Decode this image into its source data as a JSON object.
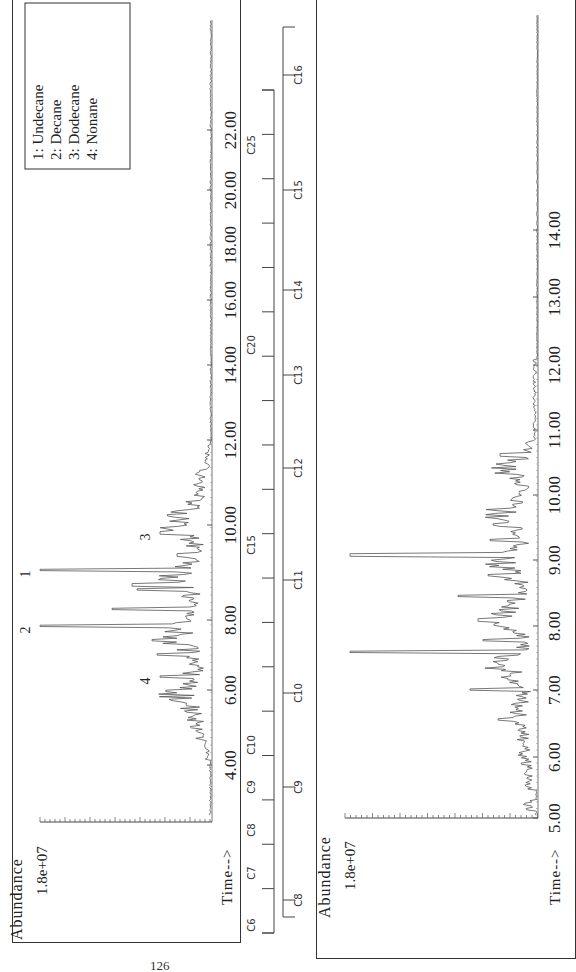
{
  "page": {
    "number": "126"
  },
  "chart_data": [
    {
      "type": "line",
      "title": "GC-MS Total Ion Chromatogram (panel 1)",
      "orientation": "rotated 90° counter-clockwise",
      "xlabel": "Time-->",
      "ylabel": "Abundance",
      "y_max_label": "1.8e+07",
      "xlim": [
        3.0,
        23.0
      ],
      "x_ticks": [
        "4.00",
        "6.00",
        "8.00",
        "10.00",
        "12.00",
        "14.00",
        "16.00",
        "18.00",
        "20.00",
        "22.00"
      ],
      "legend": [
        {
          "id": "1",
          "name": "Undecane"
        },
        {
          "id": "2",
          "name": "Decane"
        },
        {
          "id": "3",
          "name": "Dodecane"
        },
        {
          "id": "4",
          "name": "Nonane"
        }
      ],
      "labeled_peaks": [
        {
          "label": "1",
          "time": 9.7,
          "rel_abundance": 1.0
        },
        {
          "label": "2",
          "time": 8.15,
          "rel_abundance": 1.0
        },
        {
          "label": "3",
          "time": 10.7,
          "rel_abundance": 0.3
        },
        {
          "label": "4",
          "time": 6.75,
          "rel_abundance": 0.3
        }
      ],
      "carbon_ladder": {
        "labels": [
          "C6",
          "C7",
          "C8",
          "C9",
          "C10",
          "C15",
          "C20",
          "C25"
        ],
        "tick_count": 20
      }
    },
    {
      "type": "line",
      "title": "GC-MS Total Ion Chromatogram (panel 2, expanded)",
      "orientation": "rotated 90° counter-clockwise",
      "xlabel": "Time-->",
      "ylabel": "Abundance",
      "y_max_label": "1.8e+07",
      "xlim": [
        5.0,
        15.0
      ],
      "x_ticks": [
        "5.00",
        "6.00",
        "7.00",
        "8.00",
        "9.00",
        "10.00",
        "11.00",
        "12.00",
        "13.00",
        "14.00"
      ],
      "major_peaks": [
        {
          "time": 8.15,
          "rel_abundance": 0.97
        },
        {
          "time": 9.75,
          "rel_abundance": 0.97
        },
        {
          "time": 8.75,
          "rel_abundance": 0.42
        },
        {
          "time": 6.75,
          "rel_abundance": 0.35
        },
        {
          "time": 10.85,
          "rel_abundance": 0.18
        }
      ],
      "carbon_ladder": {
        "labels": [
          "C8",
          "C9",
          "C10",
          "C11",
          "C12",
          "C13",
          "C14",
          "C15",
          "C16"
        ]
      }
    }
  ],
  "panel1": {
    "ylabel": "Abundance",
    "ymax": "1.8e+07",
    "xlabel": "Time-->",
    "ticks": [
      {
        "label": "4.00",
        "y": 765
      },
      {
        "label": "6.00",
        "y": 690
      },
      {
        "label": "8.00",
        "y": 620
      },
      {
        "label": "10.00",
        "y": 525
      },
      {
        "label": "12.00",
        "y": 440
      },
      {
        "label": "14.00",
        "y": 365
      },
      {
        "label": "16.00",
        "y": 300
      },
      {
        "label": "18.00",
        "y": 245
      },
      {
        "label": "20.00",
        "y": 190
      },
      {
        "label": "22.00",
        "y": 130
      }
    ],
    "legend": [
      "1: Undecane",
      "2: Decane",
      "3: Dodecane",
      "4: Nonane"
    ],
    "peak_labels": [
      {
        "label": "1",
        "x": 30,
        "y": 570
      },
      {
        "label": "2",
        "x": 30,
        "y": 626
      },
      {
        "label": "3",
        "x": 150,
        "y": 533
      },
      {
        "label": "4",
        "x": 150,
        "y": 677
      }
    ]
  },
  "ladder1": {
    "labels": [
      {
        "text": "C6",
        "y": 925
      },
      {
        "text": "C7",
        "y": 873
      },
      {
        "text": "C8",
        "y": 830
      },
      {
        "text": "C9",
        "y": 787
      },
      {
        "text": "C10",
        "y": 745
      },
      {
        "text": "C15",
        "y": 545
      },
      {
        "text": "C20",
        "y": 345
      },
      {
        "text": "C25",
        "y": 145
      }
    ]
  },
  "ladder2": {
    "labels": [
      {
        "text": "C8",
        "y": 900
      },
      {
        "text": "C9",
        "y": 787
      },
      {
        "text": "C10",
        "y": 693
      },
      {
        "text": "C11",
        "y": 580
      },
      {
        "text": "C12",
        "y": 468
      },
      {
        "text": "C13",
        "y": 375
      },
      {
        "text": "C14",
        "y": 290
      },
      {
        "text": "C15",
        "y": 190
      },
      {
        "text": "C16",
        "y": 75
      }
    ]
  },
  "panel2": {
    "ylabel": "Abundance",
    "ymax": "1.8e+07",
    "xlabel": "Time-->",
    "ticks": [
      {
        "label": "5.00",
        "y": 818
      },
      {
        "label": "6.00",
        "y": 757
      },
      {
        "label": "7.00",
        "y": 690
      },
      {
        "label": "8.00",
        "y": 626
      },
      {
        "label": "9.00",
        "y": 560
      },
      {
        "label": "10.00",
        "y": 495
      },
      {
        "label": "11.00",
        "y": 430
      },
      {
        "label": "12.00",
        "y": 365
      },
      {
        "label": "13.00",
        "y": 297
      },
      {
        "label": "14.00",
        "y": 230
      }
    ]
  }
}
